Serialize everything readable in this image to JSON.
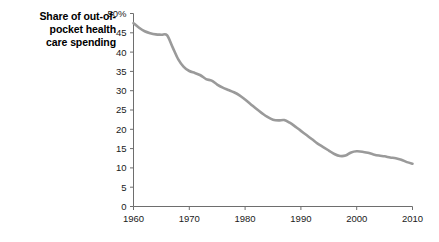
{
  "chart_data": {
    "type": "line",
    "title_lines": [
      "Share of out-of-",
      "pocket health",
      "care spending"
    ],
    "xlabel": "",
    "ylabel": "",
    "xlim": [
      1960,
      2010
    ],
    "ylim": [
      0,
      50
    ],
    "grid": false,
    "legend": "none",
    "series_color": "#9a9a9a",
    "axis_color": "#6e6e6e",
    "yticks": [
      0,
      5,
      10,
      15,
      20,
      25,
      30,
      35,
      40,
      45,
      50
    ],
    "ytick_labels": [
      "0",
      "5",
      "10",
      "15",
      "20",
      "25",
      "30",
      "35",
      "40",
      "45",
      "50%"
    ],
    "xticks": [
      1960,
      1970,
      1980,
      1990,
      2000,
      2010
    ],
    "xtick_labels": [
      "1960",
      "1970",
      "1980",
      "1990",
      "2000",
      "2010"
    ],
    "series": [
      {
        "name": "Share of out-of-pocket health care spending",
        "x": [
          1960,
          1961,
          1962,
          1963,
          1964,
          1965,
          1966,
          1967,
          1968,
          1969,
          1970,
          1971,
          1972,
          1973,
          1974,
          1975,
          1976,
          1977,
          1978,
          1979,
          1980,
          1981,
          1982,
          1983,
          1984,
          1985,
          1986,
          1987,
          1988,
          1989,
          1990,
          1991,
          1992,
          1993,
          1994,
          1995,
          1996,
          1997,
          1998,
          1999,
          2000,
          2001,
          2002,
          2003,
          2004,
          2005,
          2006,
          2007,
          2008,
          2009,
          2010
        ],
        "values": [
          47.5,
          46.3,
          45.4,
          44.9,
          44.6,
          44.5,
          44.4,
          41.3,
          38.2,
          36.2,
          35.1,
          34.6,
          34.0,
          33.0,
          32.6,
          31.6,
          30.8,
          30.2,
          29.6,
          28.8,
          27.7,
          26.5,
          25.3,
          24.2,
          23.2,
          22.5,
          22.3,
          22.4,
          21.7,
          20.7,
          19.6,
          18.5,
          17.4,
          16.3,
          15.4,
          14.5,
          13.6,
          13.1,
          13.2,
          14.0,
          14.3,
          14.2,
          13.9,
          13.5,
          13.2,
          13.0,
          12.7,
          12.5,
          12.1,
          11.5,
          11.1
        ]
      }
    ]
  }
}
